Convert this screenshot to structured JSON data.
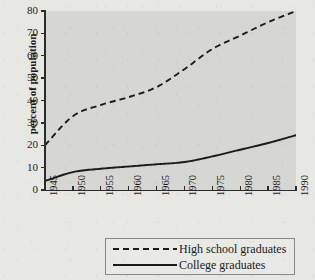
{
  "chart_data": {
    "type": "line",
    "title": "",
    "xlabel": "",
    "ylabel": "percent of population",
    "x": [
      1945,
      1950,
      1955,
      1960,
      1965,
      1970,
      1975,
      1980,
      1985,
      1990
    ],
    "xtick_labels": [
      "1945",
      "1950",
      "1955",
      "1960",
      "1965",
      "1970",
      "1975",
      "1980",
      "1985",
      "1990"
    ],
    "ytick_labels": [
      "0",
      "10",
      "20",
      "30",
      "40",
      "50",
      "60",
      "70",
      "80"
    ],
    "ytick_values": [
      0,
      10,
      20,
      30,
      40,
      50,
      60,
      70,
      80
    ],
    "xlim": [
      1945,
      1990
    ],
    "ylim": [
      0,
      80
    ],
    "grid": false,
    "legend_position": "below-center",
    "series": [
      {
        "name": "High school graduates",
        "style": "dashed",
        "color": "#1b1b1b",
        "values": [
          20,
          33,
          38,
          41.5,
          46,
          54,
          63,
          69,
          75,
          80
        ]
      },
      {
        "name": "College graduates",
        "style": "solid",
        "color": "#1b1b1b",
        "values": [
          4,
          8,
          9.5,
          10.5,
          11.5,
          12.5,
          15,
          18,
          21,
          24.5
        ]
      }
    ]
  },
  "axes": {
    "y_title": "percent of population"
  },
  "legend": {
    "entries": [
      {
        "label": "High school graduates",
        "style": "dashed"
      },
      {
        "label": "College graduates",
        "style": "solid"
      }
    ]
  },
  "colors": {
    "page_background": "#e7e7e4",
    "plot_background": "#d6d6d3",
    "axis": "#2c2c2c",
    "line": "#1b1b1b",
    "legend_border": "#8a8a88"
  }
}
